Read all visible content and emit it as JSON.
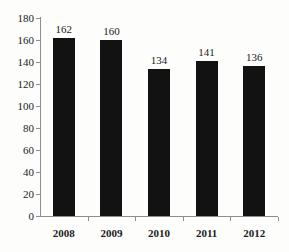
{
  "chart_data": {
    "type": "bar",
    "title": "",
    "subtitle": "",
    "xlabel": "",
    "ylabel": "",
    "categories": [
      "2008",
      "2009",
      "2010",
      "2011",
      "2012"
    ],
    "values": [
      162,
      160,
      134,
      141,
      136
    ],
    "series": [
      {
        "name": "",
        "values": [
          162,
          160,
          134,
          141,
          136
        ]
      }
    ],
    "ylim": [
      0,
      180
    ],
    "ytick_step": 20,
    "yticks": [
      0,
      20,
      40,
      60,
      80,
      100,
      120,
      140,
      160,
      180
    ],
    "ytick_labels": [
      "0",
      "20",
      "40",
      "60",
      "80",
      "100",
      "120",
      "140",
      "160",
      "180"
    ],
    "data_labels": [
      "162",
      "160",
      "134",
      "141",
      "136"
    ],
    "grid": false,
    "legend": false,
    "legend_position": "none",
    "bar_color": "#121212",
    "axis_color": "#8d8d8d",
    "text_color": "#1b1b1b",
    "background_color": "#fdfdfc"
  }
}
